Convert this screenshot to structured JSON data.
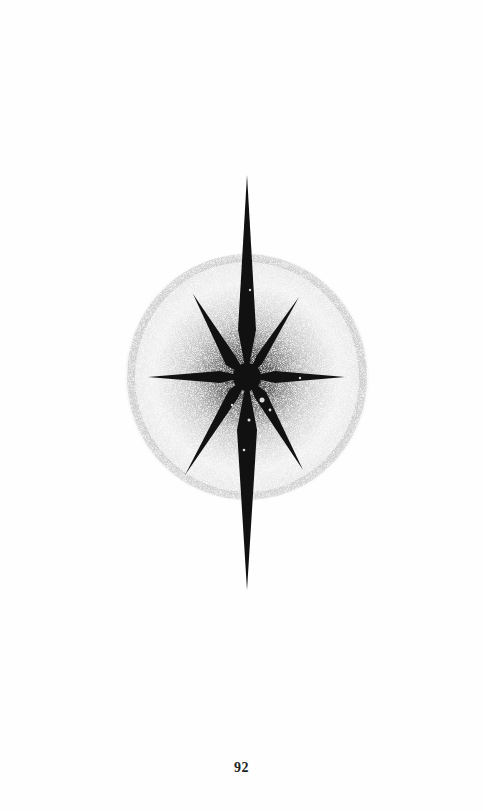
{
  "page": {
    "type": "book-page",
    "ornament": {
      "name": "eight-pointed-star",
      "description": "Stippled eight-pointed star with halo",
      "color": "#111111",
      "halo_color": "#9a9a9a"
    },
    "page_number": "92"
  }
}
